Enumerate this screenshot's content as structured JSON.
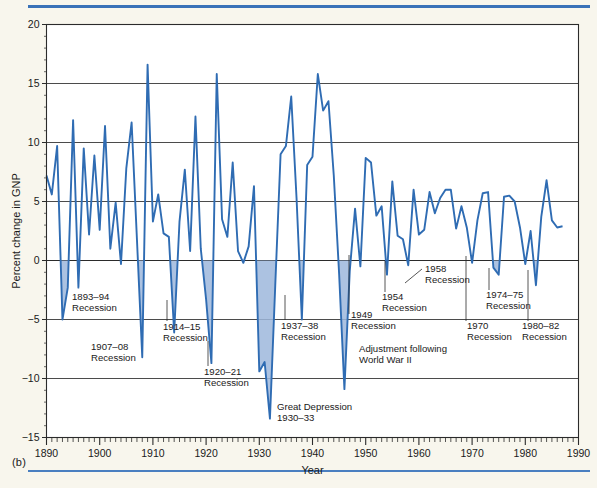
{
  "figure": {
    "panel_label": "(b)",
    "accent_color": "#3a72b8",
    "line_color": "#2f6cb3",
    "fill_color": "#9db7dc",
    "background_color": "#f8f6ed"
  },
  "chart_data": {
    "type": "line",
    "title": "",
    "xlabel": "Year",
    "ylabel": "Percent change in GNP",
    "xlim": [
      1890,
      1990
    ],
    "ylim": [
      -15,
      20
    ],
    "grid": true,
    "legend": null,
    "xticks": [
      1890,
      1900,
      1910,
      1920,
      1930,
      1940,
      1950,
      1960,
      1970,
      1980,
      1990
    ],
    "xtick_labels": [
      "1890",
      "1900",
      "1910",
      "1920",
      "1930",
      "1940",
      "1950",
      "1960",
      "1970",
      "1980",
      "1990"
    ],
    "yticks": [
      -15,
      -10,
      -5,
      0,
      5,
      10,
      15,
      20
    ],
    "ytick_labels": [
      "-15",
      "-10",
      "-5",
      "0",
      "5",
      "10",
      "15",
      "20"
    ],
    "minor_xtick_interval": 1,
    "minor_ytick_interval": 1,
    "x": [
      1890,
      1891,
      1892,
      1893,
      1894,
      1895,
      1896,
      1897,
      1898,
      1899,
      1900,
      1901,
      1902,
      1903,
      1904,
      1905,
      1906,
      1907,
      1908,
      1909,
      1910,
      1911,
      1912,
      1913,
      1914,
      1915,
      1916,
      1917,
      1918,
      1919,
      1920,
      1921,
      1922,
      1923,
      1924,
      1925,
      1926,
      1927,
      1928,
      1929,
      1930,
      1931,
      1932,
      1933,
      1934,
      1935,
      1936,
      1937,
      1938,
      1939,
      1940,
      1941,
      1942,
      1943,
      1944,
      1945,
      1946,
      1947,
      1948,
      1949,
      1950,
      1951,
      1952,
      1953,
      1954,
      1955,
      1956,
      1957,
      1958,
      1959,
      1960,
      1961,
      1962,
      1963,
      1964,
      1965,
      1966,
      1967,
      1968,
      1969,
      1970,
      1971,
      1972,
      1973,
      1974,
      1975,
      1976,
      1977,
      1978,
      1979,
      1980,
      1981,
      1982,
      1983,
      1984,
      1985,
      1986,
      1987
    ],
    "values": [
      7.2,
      5.6,
      9.7,
      -5.0,
      -2.3,
      11.9,
      -2.3,
      9.5,
      2.2,
      8.9,
      2.6,
      11.4,
      1.0,
      4.9,
      -0.3,
      7.8,
      11.7,
      1.8,
      -8.2,
      16.6,
      3.3,
      5.6,
      2.3,
      2.0,
      -6.1,
      3.3,
      7.7,
      0.8,
      12.2,
      1.0,
      -3.3,
      -8.7,
      15.8,
      3.5,
      2.0,
      8.3,
      0.8,
      -0.2,
      1.2,
      6.3,
      -9.4,
      -8.6,
      -13.4,
      -2.1,
      9.0,
      9.7,
      13.9,
      5.3,
      -5.0,
      8.1,
      8.8,
      15.8,
      12.7,
      13.5,
      7.2,
      -1.1,
      -10.9,
      -0.9,
      4.4,
      -0.5,
      8.7,
      8.3,
      3.8,
      4.6,
      -1.2,
      6.7,
      2.1,
      1.8,
      -0.4,
      6.0,
      2.2,
      2.6,
      5.8,
      4.0,
      5.3,
      6.0,
      6.0,
      2.7,
      4.6,
      2.8,
      -0.2,
      3.4,
      5.7,
      5.8,
      -0.6,
      -1.2,
      5.4,
      5.5,
      5.0,
      2.8,
      -0.3,
      2.5,
      -2.1,
      3.7,
      6.8,
      3.4,
      2.8,
      2.9
    ],
    "shaded_periods": [
      {
        "label": "1893-94 Recession",
        "start": 1893,
        "end": 1894
      },
      {
        "label": "1907-08 Recession",
        "start": 1907,
        "end": 1908
      },
      {
        "label": "1914-15 Recession",
        "start": 1914,
        "end": 1915
      },
      {
        "label": "1920-21 Recession",
        "start": 1920,
        "end": 1921
      },
      {
        "label": "Great Depression 1930-33",
        "start": 1930,
        "end": 1933
      },
      {
        "label": "1937-38 Recession",
        "start": 1937,
        "end": 1938
      },
      {
        "label": "1945-46 Adjustment",
        "start": 1945,
        "end": 1946
      },
      {
        "label": "1954 Recession",
        "start": 1954,
        "end": 1954
      },
      {
        "label": "1958 Recession",
        "start": 1958,
        "end": 1958
      },
      {
        "label": "1970 Recession",
        "start": 1970,
        "end": 1970
      },
      {
        "label": "1974-75 Recession",
        "start": 1974,
        "end": 1975
      },
      {
        "label": "1980-82 Recession",
        "start": 1980,
        "end": 1982
      }
    ],
    "annotations": [
      {
        "id": "ann-1893",
        "lines": [
          "1893–94",
          "Recession"
        ],
        "x": 72,
        "y": 300,
        "leader": null
      },
      {
        "id": "ann-1907",
        "lines": [
          "1907–08",
          "Recession"
        ],
        "x": 91,
        "y": 350,
        "leader": null
      },
      {
        "id": "ann-1914",
        "lines": [
          "1914–15",
          "Recession"
        ],
        "x": 163,
        "y": 330,
        "leader": {
          "x1": 167,
          "y1": 300,
          "x2": 167,
          "y2": 321
        }
      },
      {
        "id": "ann-1920",
        "lines": [
          "1920–21",
          "Recession"
        ],
        "x": 204,
        "y": 375,
        "leader": {
          "x1": 208,
          "y1": 341,
          "x2": 208,
          "y2": 366
        }
      },
      {
        "id": "ann-depression",
        "lines": [
          "Great Depression",
          "1930–33"
        ],
        "x": 277,
        "y": 410,
        "leader": null
      },
      {
        "id": "ann-1937",
        "lines": [
          "1937–38",
          "Recession"
        ],
        "x": 281,
        "y": 329,
        "leader": {
          "x1": 285,
          "y1": 295,
          "x2": 285,
          "y2": 320
        }
      },
      {
        "id": "ann-1949",
        "lines": [
          "1949",
          "Recession"
        ],
        "x": 351,
        "y": 318,
        "leader": {
          "x1": 349,
          "y1": 255,
          "x2": 349,
          "y2": 314
        }
      },
      {
        "id": "ann-ww2",
        "lines": [
          "Adjustment following",
          "World War II"
        ],
        "x": 359,
        "y": 352,
        "leader": null
      },
      {
        "id": "ann-1954",
        "lines": [
          "1954",
          "Recession"
        ],
        "x": 382,
        "y": 300,
        "leader": {
          "x1": 385,
          "y1": 261,
          "x2": 385,
          "y2": 292
        }
      },
      {
        "id": "ann-1958",
        "lines": [
          "1958",
          "Recession"
        ],
        "x": 425,
        "y": 272,
        "leader": {
          "x1": 405,
          "y1": 283,
          "x2": 422,
          "y2": 269
        }
      },
      {
        "id": "ann-1970",
        "lines": [
          "1970",
          "Recession"
        ],
        "x": 467,
        "y": 329,
        "leader": {
          "x1": 466,
          "y1": 256,
          "x2": 466,
          "y2": 321
        }
      },
      {
        "id": "ann-1974",
        "lines": [
          "1974–75",
          "Recession"
        ],
        "x": 486,
        "y": 298,
        "leader": {
          "x1": 489,
          "y1": 268,
          "x2": 489,
          "y2": 290
        }
      },
      {
        "id": "ann-1980",
        "lines": [
          "1980–82",
          "Recession"
        ],
        "x": 522,
        "y": 329,
        "leader": {
          "x1": 528,
          "y1": 270,
          "x2": 528,
          "y2": 321
        }
      }
    ]
  }
}
